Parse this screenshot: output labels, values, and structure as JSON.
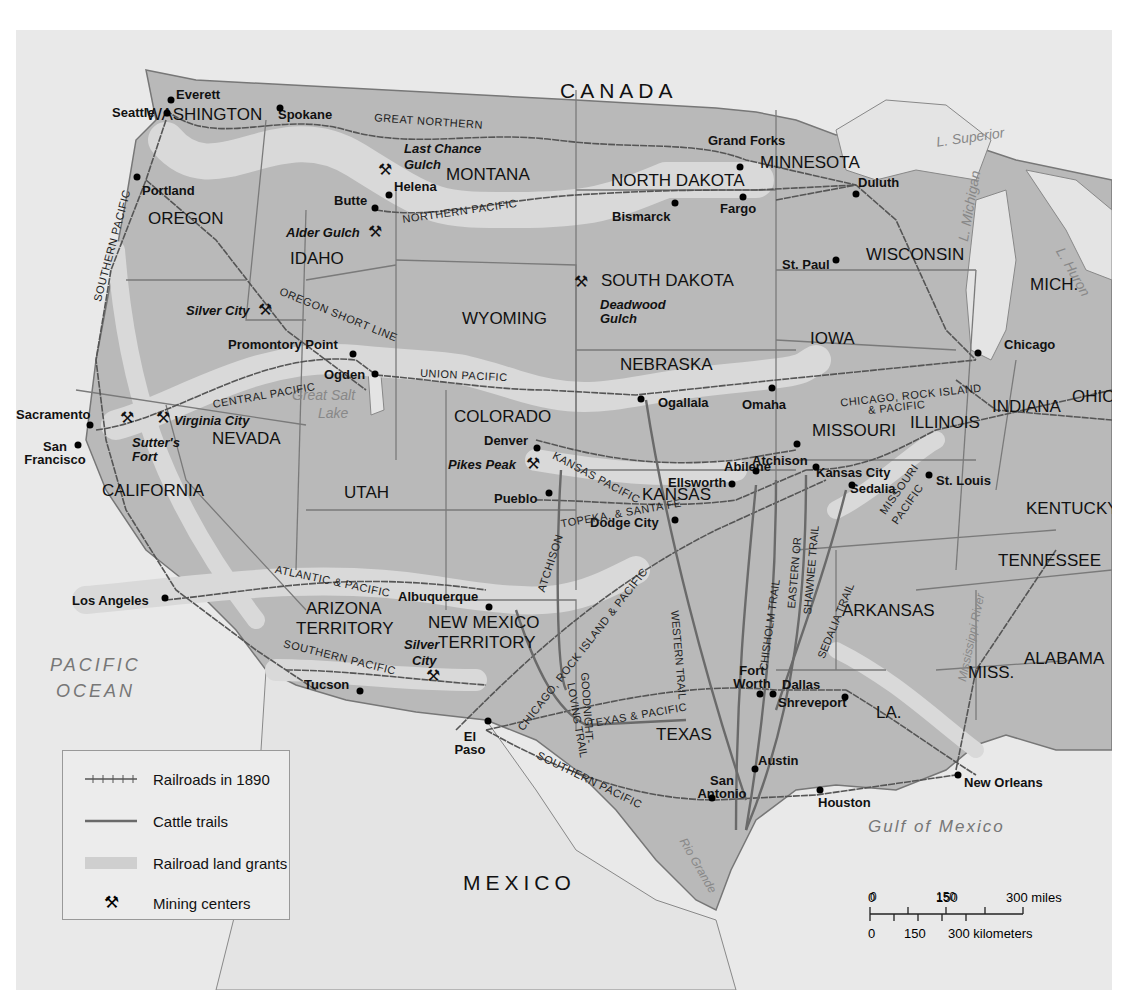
{
  "map": {
    "title": "Railroads, Cattle Trails, Land Grants and Mining Centers, 1890",
    "colors": {
      "water": "#e9e9e9",
      "land_us": "#b9b9b9",
      "land_grant": "#d9d9d9",
      "border": "#777777",
      "railroad": "#555555",
      "cattle_trail": "#6a6a6a",
      "text": "#111111"
    },
    "countries": {
      "canada": "CANADA",
      "mexico": "MEXICO"
    },
    "water_bodies": {
      "pacific": "PACIFIC OCEAN",
      "pacific_line1": "PACIFIC",
      "pacific_line2": "OCEAN",
      "gulf": "Gulf of Mexico",
      "superior": "L. Superior",
      "michigan": "L. Michigan",
      "huron": "L. Huron",
      "great_salt_lake_1": "Great Salt",
      "great_salt_lake_2": "Lake",
      "mississippi": "Mississippi River",
      "rio_grande": "Rio Grande"
    },
    "states": {
      "washington": "WASHINGTON",
      "oregon": "OREGON",
      "california": "CALIFORNIA",
      "nevada": "NEVADA",
      "idaho": "IDAHO",
      "montana": "MONTANA",
      "wyoming": "WYOMING",
      "utah": "UTAH",
      "colorado": "COLORADO",
      "arizona_1": "ARIZONA",
      "arizona_2": "TERRITORY",
      "new_mexico_1": "NEW MEXICO",
      "new_mexico_2": "TERRITORY",
      "north_dakota": "NORTH DAKOTA",
      "south_dakota": "SOUTH DAKOTA",
      "nebraska": "NEBRASKA",
      "kansas": "KANSAS",
      "texas": "TEXAS",
      "minnesota": "MINNESOTA",
      "iowa": "IOWA",
      "missouri": "MISSOURI",
      "arkansas": "ARKANSAS",
      "louisiana": "LA.",
      "wisconsin": "WISCONSIN",
      "illinois": "ILLINOIS",
      "michigan": "MICH.",
      "indiana": "INDIANA",
      "ohio": "OHIO",
      "kentucky": "KENTUCKY",
      "tennessee": "TENNESSEE",
      "mississippi": "MISS.",
      "alabama": "ALABAMA"
    },
    "cities": [
      {
        "name": "Everett"
      },
      {
        "name": "Seattle"
      },
      {
        "name": "Spokane"
      },
      {
        "name": "Portland"
      },
      {
        "name": "Helena"
      },
      {
        "name": "Butte"
      },
      {
        "name": "Grand Forks"
      },
      {
        "name": "Bismarck"
      },
      {
        "name": "Fargo"
      },
      {
        "name": "Duluth"
      },
      {
        "name": "St. Paul"
      },
      {
        "name": "Promontory Point"
      },
      {
        "name": "Ogden"
      },
      {
        "name": "Sacramento"
      },
      {
        "name": "San Francisco"
      },
      {
        "name": "Ogallala"
      },
      {
        "name": "Omaha"
      },
      {
        "name": "Chicago"
      },
      {
        "name": "Denver"
      },
      {
        "name": "Atchison"
      },
      {
        "name": "Kansas City"
      },
      {
        "name": "Sedalia"
      },
      {
        "name": "St. Louis"
      },
      {
        "name": "Abilene"
      },
      {
        "name": "Ellsworth"
      },
      {
        "name": "Pueblo"
      },
      {
        "name": "Dodge City"
      },
      {
        "name": "Los Angeles"
      },
      {
        "name": "Albuquerque"
      },
      {
        "name": "Tucson"
      },
      {
        "name": "El Paso"
      },
      {
        "name": "Fort Worth"
      },
      {
        "name": "Dallas"
      },
      {
        "name": "Shreveport"
      },
      {
        "name": "Austin"
      },
      {
        "name": "San Antonio"
      },
      {
        "name": "Houston"
      },
      {
        "name": "New Orleans"
      }
    ],
    "mining_centers": [
      {
        "name_1": "Last Chance",
        "name_2": "Gulch"
      },
      {
        "name": "Alder Gulch"
      },
      {
        "name_1": "Deadwood",
        "name_2": "Gulch"
      },
      {
        "name": "Silver City"
      },
      {
        "name": "Virginia City"
      },
      {
        "name_1": "Sutter's",
        "name_2": "Fort"
      },
      {
        "name": "Pikes Peak"
      },
      {
        "name_1": "Silver",
        "name_2": "City"
      }
    ],
    "railroads": {
      "great_northern": "GREAT NORTHERN",
      "northern_pacific": "NORTHERN PACIFIC",
      "southern_pacific_west": "SOUTHERN PACIFIC",
      "oregon_short_line": "OREGON SHORT LINE",
      "central_pacific": "CENTRAL PACIFIC",
      "union_pacific": "UNION PACIFIC",
      "kansas_pacific": "KANSAS PACIFIC",
      "atchison_topeka": "ATCHISON, TOPEKA, & SANTA FE",
      "atchison_part": "ATCHISON",
      "topeka_part": "TOPEKA, & SANTA FE",
      "chicago_rock_island_1": "CHICAGO, ROCK ISLAND",
      "chicago_rock_island_2": "& PACIFIC",
      "chicago_rock_island_sw": "CHICAGO, ROCK ISLAND & PACIFIC",
      "atlantic_pacific": "ATLANTIC & PACIFIC",
      "southern_pacific_az": "SOUTHERN PACIFIC",
      "texas_pacific": "TEXAS & PACIFIC",
      "southern_pacific_tx": "SOUTHERN PACIFIC",
      "missouri_pacific_1": "MISSOURI",
      "missouri_pacific_2": "PACIFIC"
    },
    "cattle_trails": {
      "western": "WESTERN TRAIL",
      "chisholm": "CHISHOLM TRAIL",
      "eastern_1": "EASTERN OR",
      "eastern_2": "SHAWNEE TRAIL",
      "sedalia": "SEDALIA TRAIL",
      "goodnight_1": "GOODNIGHT-",
      "goodnight_2": "LOVING TRAIL"
    }
  },
  "legend": {
    "items": [
      {
        "symbol": "railroad-line",
        "label": "Railroads in 1890"
      },
      {
        "symbol": "cattle-trail-line",
        "label": "Cattle trails"
      },
      {
        "symbol": "land-grant-band",
        "label": "Railroad land grants"
      },
      {
        "symbol": "pick-axe-icon",
        "label": "Mining centers"
      }
    ]
  },
  "scale_bar": {
    "miles": {
      "ticks": [
        "0",
        "150",
        "300 miles"
      ]
    },
    "kilometers": {
      "ticks": [
        "0",
        "150",
        "300 kilometers"
      ]
    }
  }
}
